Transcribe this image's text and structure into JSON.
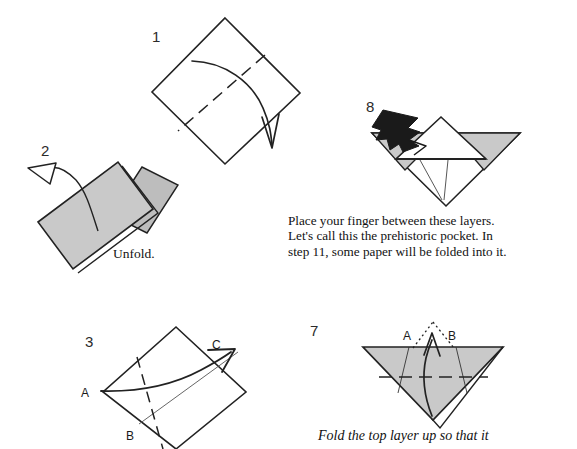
{
  "page": {
    "width": 577,
    "height": 449,
    "background": "#ffffff"
  },
  "colors": {
    "paper_gray": "#c9c9c9",
    "paper_gray_dark": "#b8b8b8",
    "line": "#222222",
    "black_arrow": "#1a1a1a",
    "white": "#ffffff"
  },
  "steps": [
    {
      "id": "step-1",
      "number": "1",
      "number_pos": {
        "x": 152,
        "y": 28
      },
      "shape": "diamond-square",
      "annotations": [
        "dashed-valley-fold-line",
        "curved-fold-arrow"
      ]
    },
    {
      "id": "step-2",
      "number": "2",
      "number_pos": {
        "x": 41,
        "y": 142
      },
      "shape": "folded-rectangle-layers",
      "instruction": "Unfold.",
      "instruction_pos": {
        "x": 113,
        "y": 246
      },
      "annotations": [
        "hollow-unfold-arrow"
      ]
    },
    {
      "id": "step-3",
      "number": "3",
      "number_pos": {
        "x": 85,
        "y": 333
      },
      "shape": "diamond-square",
      "vertex_labels": [
        {
          "text": "A",
          "x": 81,
          "y": 386
        },
        {
          "text": "B",
          "x": 126,
          "y": 429
        },
        {
          "text": "C",
          "x": 212,
          "y": 338
        }
      ],
      "annotations": [
        "dashed-valley-fold-line",
        "thin-crease-line",
        "curved-arrow-a-to-c"
      ]
    },
    {
      "id": "step-7",
      "number": "7",
      "number_pos": {
        "x": 310,
        "y": 322
      },
      "shape": "inverted-gray-triangle",
      "vertex_labels": [
        {
          "text": "A",
          "x": 403,
          "y": 329
        },
        {
          "text": "B",
          "x": 448,
          "y": 329
        }
      ],
      "annotations": [
        "dashed-horizontal-fold-line",
        "dotted-peak-lines",
        "curved-up-arrow",
        "layer-edge-lines"
      ],
      "instruction": "Fold the top layer up so that it",
      "instruction_pos": {
        "x": 318,
        "y": 428
      }
    },
    {
      "id": "step-8",
      "number": "8",
      "number_pos": {
        "x": 366,
        "y": 98
      },
      "shape": "prehistoric-pocket-form",
      "annotations": [
        "black-insert-arrow",
        "gray-side-flaps",
        "white-center-peak",
        "thin-v-lines"
      ],
      "instruction": "Place your finger between these layers.\nLet's call this the prehistoric pocket.  In\nstep 11, some paper will be folded into it.",
      "instruction_pos": {
        "x": 288,
        "y": 213
      }
    }
  ]
}
